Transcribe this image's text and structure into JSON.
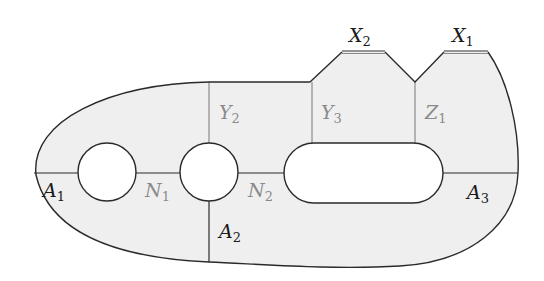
{
  "diagram": {
    "type": "surface-decomposition",
    "colors": {
      "fill": "#efefef",
      "outline": "#2a2a2a",
      "gray_line": "#8a8a8a",
      "dark_label": "#1a1a1a",
      "gray_label": "#8a8a8a"
    },
    "labels": {
      "X2": {
        "main": "X",
        "sub": "2"
      },
      "X1": {
        "main": "X",
        "sub": "1"
      },
      "Y2": {
        "main": "Y",
        "sub": "2"
      },
      "Y3": {
        "main": "Y",
        "sub": "3"
      },
      "Z1": {
        "main": "Z",
        "sub": "1"
      },
      "A1": {
        "main": "A",
        "sub": "1"
      },
      "N1": {
        "main": "N",
        "sub": "1"
      },
      "N2": {
        "main": "N",
        "sub": "2"
      },
      "A2": {
        "main": "A",
        "sub": "2"
      },
      "A3": {
        "main": "A",
        "sub": "3"
      }
    },
    "holes": [
      {
        "name": "left-circle"
      },
      {
        "name": "middle-circle"
      },
      {
        "name": "stadium"
      }
    ]
  }
}
